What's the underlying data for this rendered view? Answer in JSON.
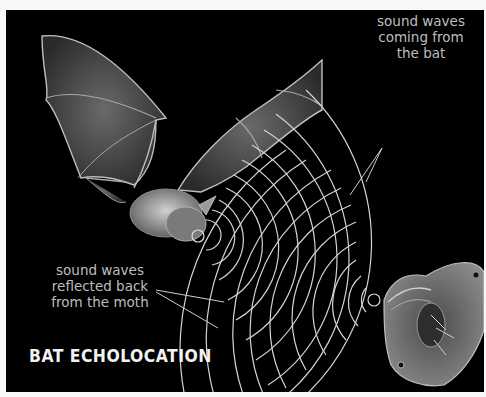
{
  "diagram": {
    "title": "BAT ECHOLOCATION",
    "labels": {
      "outgoing": [
        "sound waves",
        "coming from",
        "the bat"
      ],
      "reflected": [
        "sound waves",
        "reflected back",
        "from the moth"
      ]
    },
    "subjects": {
      "bat": "bat",
      "moth": "moth"
    },
    "colors": {
      "background": "#000000",
      "frame": "#f7f7f7",
      "wave_lines": "#d8d8d8",
      "label_text": "#bdbdbd",
      "title_text": "#f2f2f2"
    }
  }
}
